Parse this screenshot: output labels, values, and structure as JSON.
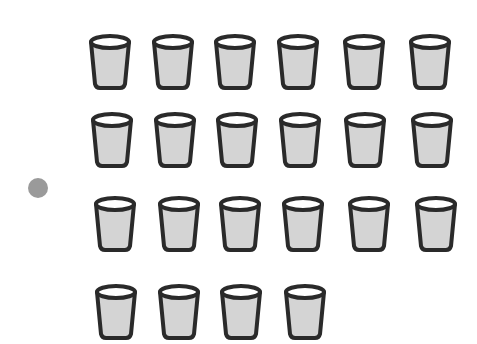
{
  "scene": {
    "description": "Illustration of cups arranged in rows with a single gray dot on the left",
    "background": "#ffffff",
    "cup_count": 22,
    "rows": [
      6,
      6,
      6,
      4
    ]
  },
  "colors": {
    "cup_fill": "#d4d4d4",
    "cup_stroke": "#2a2a2a",
    "cup_rim_inner": "#ffffff",
    "dot": "#9a9a9a"
  },
  "dot": {
    "cx": 38,
    "cy": 188,
    "r": 10
  },
  "cups": [
    {
      "x": 87,
      "y": 33
    },
    {
      "x": 150,
      "y": 33
    },
    {
      "x": 212,
      "y": 33
    },
    {
      "x": 275,
      "y": 33
    },
    {
      "x": 341,
      "y": 33
    },
    {
      "x": 407,
      "y": 33
    },
    {
      "x": 89,
      "y": 111
    },
    {
      "x": 152,
      "y": 111
    },
    {
      "x": 214,
      "y": 111
    },
    {
      "x": 277,
      "y": 111
    },
    {
      "x": 342,
      "y": 111
    },
    {
      "x": 409,
      "y": 111
    },
    {
      "x": 92,
      "y": 195
    },
    {
      "x": 156,
      "y": 195
    },
    {
      "x": 217,
      "y": 195
    },
    {
      "x": 280,
      "y": 195
    },
    {
      "x": 346,
      "y": 195
    },
    {
      "x": 413,
      "y": 195
    },
    {
      "x": 93,
      "y": 283
    },
    {
      "x": 156,
      "y": 283
    },
    {
      "x": 218,
      "y": 283
    },
    {
      "x": 282,
      "y": 283
    }
  ]
}
